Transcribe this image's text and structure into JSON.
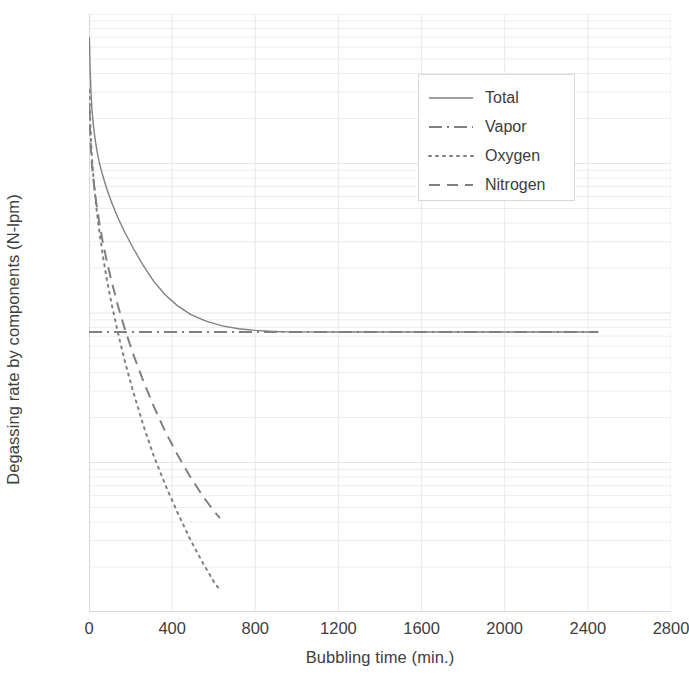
{
  "chart_data": {
    "type": "line",
    "title": "",
    "xlabel": "Bubbling time (min.)",
    "ylabel": "Degassing rate by components (N-lpm)",
    "yscale": "log",
    "xlim": [
      0,
      2800
    ],
    "ylim": [
      1e-05,
      0.1
    ],
    "grid": true,
    "legend_position": "upper right",
    "x_ticks": [
      "0",
      "400",
      "800",
      "1200",
      "1600",
      "2000",
      "2400",
      "2800"
    ],
    "x_tick_values": [
      0,
      400,
      800,
      1200,
      1600,
      2000,
      2400,
      2800
    ],
    "y_ticks": [
      "0.1",
      "0.01",
      "0.001",
      "0.0001",
      "1E-05"
    ],
    "y_tick_values": [
      0.1,
      0.01,
      0.001,
      0.0001,
      1e-05
    ],
    "line_color": "#808080",
    "series": [
      {
        "name": "Total",
        "style": "solid",
        "x": [
          2,
          5,
          9,
          14,
          20,
          28,
          38,
          50,
          65,
          85,
          110,
          140,
          175,
          215,
          260,
          310,
          365,
          425,
          490,
          560,
          640,
          720,
          800,
          870,
          930,
          1000,
          1200,
          1500,
          1800,
          2100,
          2300,
          2450
        ],
        "y": [
          0.07,
          0.045,
          0.031,
          0.0232,
          0.0186,
          0.015,
          0.0122,
          0.0101,
          0.0084,
          0.0068,
          0.00545,
          0.0043,
          0.0034,
          0.00268,
          0.00209,
          0.00164,
          0.00133,
          0.00112,
          0.000975,
          0.000885,
          0.00082,
          0.000785,
          0.000765,
          0.000755,
          0.00075,
          0.000748,
          0.000747,
          0.000747,
          0.000747,
          0.000747,
          0.000747,
          0.000747
        ]
      },
      {
        "name": "Vapor",
        "style": "dash-dot",
        "x": [
          0,
          400,
          800,
          1200,
          1600,
          2000,
          2450
        ],
        "y": [
          0.000747,
          0.000747,
          0.000747,
          0.000747,
          0.000747,
          0.000747,
          0.000747
        ]
      },
      {
        "name": "Oxygen",
        "style": "dotted",
        "x": [
          2,
          5,
          9,
          14,
          20,
          28,
          38,
          50,
          65,
          85,
          110,
          140,
          175,
          215,
          260,
          310,
          365,
          425,
          490,
          550,
          600,
          630
        ],
        "y": [
          0.031,
          0.021,
          0.0148,
          0.011,
          0.0085,
          0.0064,
          0.0047,
          0.0035,
          0.0025,
          0.0017,
          0.00113,
          0.00073,
          0.00046,
          0.00029,
          0.00018,
          0.000112,
          7.2e-05,
          4.65e-05,
          3e-05,
          2.1e-05,
          1.6e-05,
          1.4e-05
        ]
      },
      {
        "name": "Nitrogen",
        "style": "dashed",
        "x": [
          2,
          5,
          9,
          14,
          20,
          28,
          38,
          50,
          65,
          85,
          110,
          140,
          175,
          215,
          260,
          310,
          365,
          425,
          490,
          550,
          600,
          630
        ],
        "y": [
          0.024,
          0.0168,
          0.0125,
          0.0099,
          0.0081,
          0.0065,
          0.0051,
          0.004,
          0.00305,
          0.00225,
          0.0016,
          0.00111,
          0.00076,
          0.00052,
          0.000355,
          0.00024,
          0.000163,
          0.000113,
          7.9e-05,
          5.9e-05,
          4.75e-05,
          4.25e-05
        ]
      }
    ]
  },
  "axes": {
    "y_title": "Degassing rate by components (N-lpm)",
    "x_title": "Bubbling time (min.)",
    "y_labels": [
      "0.1",
      "0.01",
      "0.001",
      "0.0001",
      "1E-05"
    ],
    "x_labels": [
      "0",
      "400",
      "800",
      "1200",
      "1600",
      "2000",
      "2400",
      "2800"
    ]
  },
  "legend": {
    "items": [
      {
        "label": "Total",
        "style": "solid"
      },
      {
        "label": "Vapor",
        "style": "dash-dot"
      },
      {
        "label": "Oxygen",
        "style": "dotted"
      },
      {
        "label": "Nitrogen",
        "style": "dashed"
      }
    ]
  },
  "colors": {
    "line": "#808080",
    "grid": "#ededed",
    "axis": "#d9d9d9",
    "text": "#404040"
  }
}
